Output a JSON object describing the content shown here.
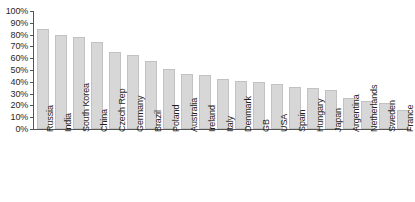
{
  "chart_data": {
    "type": "bar",
    "title": "",
    "subtitle": "",
    "xlabel": "",
    "ylabel": "",
    "ylim": [
      0,
      100
    ],
    "y_unit": "%",
    "grid": false,
    "legend": false,
    "legend_position": "none",
    "orientation": "vertical",
    "sorted": "descending",
    "bar_color": "#d7d7d7",
    "bar_border_color": "#c2c2c2",
    "axis_color": "#555555",
    "background_color": "#ffffff",
    "y_ticks": [
      "100%",
      "90%",
      "80%",
      "70%",
      "60%",
      "50%",
      "40%",
      "30%",
      "20%",
      "10%",
      "0%"
    ],
    "y_tick_values": [
      100,
      90,
      80,
      70,
      60,
      50,
      40,
      30,
      20,
      10,
      0
    ],
    "categories": [
      "Russia",
      "India",
      "South Korea",
      "China",
      "Czech Rep",
      "Germany",
      "Brazil",
      "Poland",
      "Australia",
      "Ireland",
      "Italy",
      "Denmark",
      "GB",
      "USA",
      "Spain",
      "Hungary",
      "Japan",
      "Argentina",
      "Netherlands",
      "Sweden",
      "France"
    ],
    "values": [
      85,
      80,
      78,
      74,
      65,
      63,
      58,
      51,
      47,
      46,
      42,
      41,
      40,
      38,
      36,
      35,
      33,
      26,
      24,
      22,
      16
    ]
  }
}
